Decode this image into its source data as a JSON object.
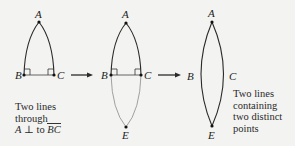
{
  "figures": [
    {
      "id": "fig1",
      "points": {
        "A": "A",
        "B": "B",
        "C": "C"
      },
      "caption": {
        "line1": "Two lines",
        "line2": "through",
        "line3_prefix": "A",
        "line3_symbol": "⊥",
        "line3_to": "to",
        "line3_segment": "BC"
      }
    },
    {
      "id": "fig2",
      "points": {
        "A": "A",
        "B": "B",
        "C": "C",
        "E": "E"
      }
    },
    {
      "id": "fig3",
      "points": {
        "A": "A",
        "B": "B",
        "C": "C",
        "E": "E"
      },
      "caption": {
        "line1": "Two lines",
        "line2": "containing",
        "line3": "two distinct",
        "line4": "points"
      }
    }
  ],
  "arrows": [
    {
      "from": "fig1",
      "to": "fig2"
    },
    {
      "from": "fig2",
      "to": "fig3"
    }
  ],
  "colors": {
    "background": "#f3f3f1",
    "ink": "#2a2a2a",
    "faint": "#8a8a8a"
  }
}
